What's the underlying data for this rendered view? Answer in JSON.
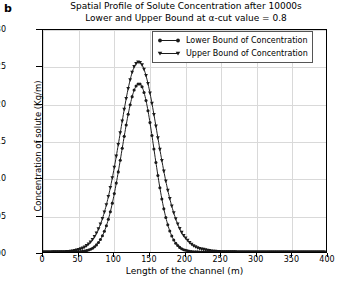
{
  "panel_label": "b",
  "chart_data": {
    "type": "line",
    "title": "Spatial Profile of Solute Concentration after 10000s",
    "subtitle": "Lower and Upper Bound at α-cut value = 0.8",
    "xlabel": "Length of the channel (m)",
    "ylabel": "Concentration of solute (Kg/m)",
    "xlim": [
      0,
      400
    ],
    "ylim": [
      0.0,
      0.03
    ],
    "xticks": [
      0,
      50,
      100,
      150,
      200,
      250,
      300,
      350,
      400
    ],
    "xtick_labels": [
      "0",
      "50",
      "100",
      "150",
      "200",
      "250",
      "300",
      "350",
      "400"
    ],
    "yticks": [
      0.0,
      0.005,
      0.01,
      0.015,
      0.02,
      0.025,
      0.03
    ],
    "ytick_labels": [
      "0.000",
      "0.005",
      "0.010",
      "0.015",
      "0.020",
      "0.025",
      "0.030"
    ],
    "grid": true,
    "legend_position": "upper right",
    "series": [
      {
        "name": "Lower Bound of Concentration",
        "marker": "circle",
        "color": "#1a1a1a",
        "peak_x": 130,
        "peak_y": 0.0255,
        "x": [
          0,
          10,
          20,
          30,
          40,
          50,
          56,
          60,
          64,
          68,
          72,
          76,
          80,
          84,
          88,
          92,
          96,
          100,
          104,
          108,
          112,
          116,
          120,
          124,
          128,
          130,
          132,
          136,
          140,
          144,
          148,
          152,
          156,
          160,
          164,
          168,
          172,
          176,
          180,
          184,
          188,
          192,
          196,
          200,
          210,
          220,
          240,
          260,
          280,
          300,
          320,
          340,
          360,
          380,
          400
        ],
        "y": [
          0.0,
          0.0,
          0.0,
          0.0,
          1e-05,
          4e-05,
          9e-05,
          0.00015,
          0.00025,
          0.00041,
          0.00065,
          0.001,
          0.0015,
          0.00219,
          0.00311,
          0.00429,
          0.00576,
          0.00751,
          0.00952,
          0.01172,
          0.01402,
          0.0163,
          0.01841,
          0.02022,
          0.02161,
          0.02212,
          0.02249,
          0.02277,
          0.02232,
          0.02113,
          0.0193,
          0.017,
          0.01444,
          0.01184,
          0.00937,
          0.00717,
          0.00531,
          0.0038,
          0.00263,
          0.00176,
          0.00114,
          0.00072,
          0.00044,
          0.00026,
          6e-05,
          1e-05,
          0.0,
          0.0,
          0.0,
          0.0,
          0.0,
          0.0,
          0.0,
          0.0,
          0.0
        ]
      },
      {
        "name": "Upper Bound of Concentration",
        "marker": "triangle-down",
        "color": "#1a1a1a",
        "peak_x": 130,
        "peak_y": 0.0258,
        "x": [
          0,
          10,
          20,
          30,
          40,
          50,
          56,
          60,
          64,
          68,
          72,
          76,
          80,
          84,
          88,
          92,
          96,
          100,
          104,
          108,
          112,
          116,
          120,
          124,
          128,
          130,
          132,
          136,
          140,
          144,
          148,
          152,
          156,
          160,
          164,
          168,
          172,
          176,
          180,
          184,
          188,
          192,
          196,
          200,
          210,
          220,
          240,
          260,
          280,
          300,
          320,
          340,
          360,
          380,
          400
        ],
        "y": [
          0.0,
          0.0,
          1e-05,
          3e-05,
          0.0001,
          0.0003,
          0.00052,
          0.00074,
          0.00104,
          0.00144,
          0.00196,
          0.00263,
          0.00348,
          0.00453,
          0.00581,
          0.00732,
          0.00907,
          0.01103,
          0.01317,
          0.01542,
          0.0177,
          0.01991,
          0.02191,
          0.02358,
          0.02481,
          0.02524,
          0.02552,
          0.02566,
          0.02528,
          0.02435,
          0.02292,
          0.0211,
          0.01901,
          0.01678,
          0.01452,
          0.01235,
          0.01033,
          0.00851,
          0.00691,
          0.00554,
          0.00438,
          0.00342,
          0.00264,
          0.00202,
          0.00103,
          0.0005,
          0.00011,
          2e-05,
          0.0,
          0.0,
          0.0,
          0.0,
          0.0,
          0.0,
          0.0
        ]
      }
    ]
  }
}
